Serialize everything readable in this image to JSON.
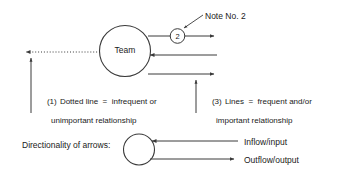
{
  "diagram": {
    "title_marker": {
      "note_label": "Note No. 2",
      "marker_number": "2"
    },
    "team_node": {
      "label": "Team"
    },
    "captions": {
      "item1_number": "(1)",
      "item1_line1": "Dotted line  =  infrequent or",
      "item1_line2": "unimportant relationship",
      "item3_number": "(3)",
      "item3_line1": "Lines  =  frequent and/or",
      "item3_line2": "important relationship"
    },
    "legend": {
      "heading": "Directionality of arrows:",
      "inflow_label": "Inflow/input",
      "outflow_label": "Outflow/output"
    },
    "colors": {
      "stroke": "#3a3a3a",
      "text": "#1a1a1a",
      "background": "#ffffff"
    }
  }
}
